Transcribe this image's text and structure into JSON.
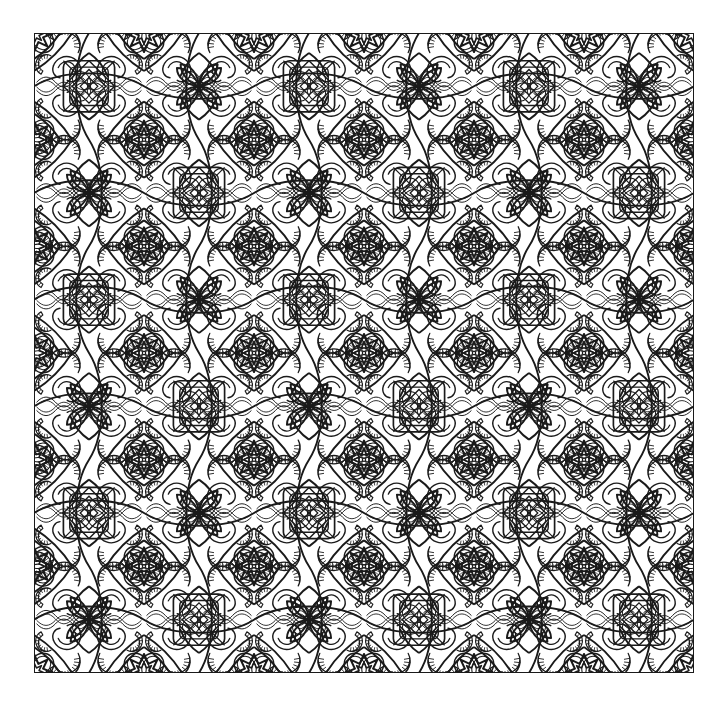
{
  "document": {
    "kind": "ornamental-pattern-illustration",
    "title": "Seamless Arabesque Coloring Pattern",
    "style": "black line art on white, coloring-book style",
    "symmetry": "4-fold mirror (horizontal + vertical axes), p4m-like tiling"
  },
  "canvas": {
    "width": 728,
    "height": 704,
    "background_color": "#ffffff"
  },
  "frame": {
    "x": 34,
    "y": 33,
    "width": 660,
    "height": 640,
    "stroke_color": "#1a1a1a",
    "stroke_width": 1.6,
    "fill_color": "#ffffff"
  },
  "artwork": {
    "ink_color": "#1a1a1a",
    "paper_color": "#ffffff",
    "stroke_width_main": 2.1,
    "stroke_width_hatch": 1.3,
    "tile_columns": 6,
    "tile_rows": 6,
    "tile_width": 110,
    "tile_height": 106.667,
    "motifs": [
      {
        "name": "teardrop-petal",
        "count_per_tile": 4
      },
      {
        "name": "hatched-crescent-arc",
        "count_per_tile": 8
      },
      {
        "name": "interlocking-loop",
        "count_per_tile": 8
      },
      {
        "name": "woven-lattice-square",
        "count_per_tile": 1
      },
      {
        "name": "eight-point-star",
        "count_per_tile": 1
      },
      {
        "name": "four-petal-rosette",
        "count_per_tile": 1
      },
      {
        "name": "scalloped-ring",
        "count_per_tile": 4
      }
    ]
  },
  "chart_data": {
    "type": "table",
    "columns": [
      "motif",
      "role",
      "symmetry"
    ],
    "rows": [
      [
        "teardrop-petal",
        "corner fill",
        "mirror"
      ],
      [
        "hatched-crescent-arc",
        "texture accent",
        "rotational"
      ],
      [
        "interlocking-loop",
        "connective band",
        "mirror"
      ],
      [
        "woven-lattice-square",
        "tile center",
        "4-fold"
      ],
      [
        "eight-point-star",
        "node accent",
        "8-fold"
      ],
      [
        "four-petal-rosette",
        "node accent",
        "4-fold"
      ],
      [
        "scalloped-ring",
        "edge fill",
        "mirror"
      ]
    ]
  }
}
